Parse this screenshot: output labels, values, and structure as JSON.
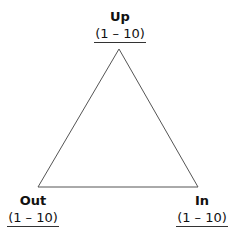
{
  "diagram": {
    "type": "triangle",
    "vertices": {
      "top": {
        "label": "Up",
        "range": "(1 – 10)"
      },
      "bottom_left": {
        "label": "Out",
        "range": "(1 – 10)"
      },
      "bottom_right": {
        "label": "In",
        "range": "(1 – 10)"
      }
    },
    "stroke_color": "#555555"
  }
}
